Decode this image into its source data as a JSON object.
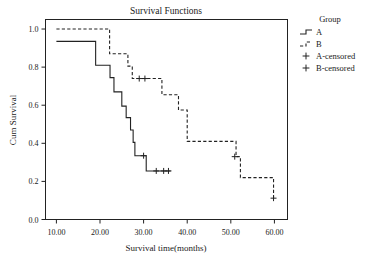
{
  "chart_data": {
    "type": "line",
    "subtype": "kaplan-meier-survival-step",
    "title": "Survival Functions",
    "xlabel": "Survival time(months)",
    "ylabel": "Cum Survival",
    "xlim": [
      7.5,
      63.0
    ],
    "ylim": [
      0.0,
      1.05
    ],
    "xticks": [
      10,
      20,
      30,
      40,
      50,
      60
    ],
    "xticklabels": [
      "10.00",
      "20.00",
      "30.00",
      "40.00",
      "50.00",
      "60.00"
    ],
    "yticks": [
      0.0,
      0.2,
      0.4,
      0.6,
      0.8,
      1.0
    ],
    "yticklabels": [
      "0.0",
      "0.2",
      "0.4",
      "0.6",
      "0.8",
      "1.0"
    ],
    "grid": false,
    "legend_position": "right",
    "legend_title": "Group",
    "legend_entries": [
      {
        "label": "A",
        "style": "solid-step"
      },
      {
        "label": "B",
        "style": "dashed-step"
      },
      {
        "label": "A-censored",
        "style": "plus-marker"
      },
      {
        "label": "B-censored",
        "style": "plus-marker"
      }
    ],
    "series": [
      {
        "name": "A",
        "style": "solid",
        "steps": [
          {
            "x": 10.0,
            "y": 0.935
          },
          {
            "x": 19.0,
            "y": 0.935
          },
          {
            "x": 19.0,
            "y": 0.81
          },
          {
            "x": 22.3,
            "y": 0.81
          },
          {
            "x": 22.3,
            "y": 0.745
          },
          {
            "x": 23.2,
            "y": 0.745
          },
          {
            "x": 23.2,
            "y": 0.67
          },
          {
            "x": 25.0,
            "y": 0.67
          },
          {
            "x": 25.0,
            "y": 0.595
          },
          {
            "x": 26.0,
            "y": 0.595
          },
          {
            "x": 26.0,
            "y": 0.535
          },
          {
            "x": 27.0,
            "y": 0.535
          },
          {
            "x": 27.0,
            "y": 0.47
          },
          {
            "x": 27.6,
            "y": 0.47
          },
          {
            "x": 27.6,
            "y": 0.405
          },
          {
            "x": 28.0,
            "y": 0.405
          },
          {
            "x": 28.0,
            "y": 0.335
          },
          {
            "x": 30.6,
            "y": 0.335
          },
          {
            "x": 30.6,
            "y": 0.255
          },
          {
            "x": 36.2,
            "y": 0.255
          }
        ],
        "censored_points": [
          {
            "x": 30.0,
            "y": 0.335
          },
          {
            "x": 32.9,
            "y": 0.255
          },
          {
            "x": 34.6,
            "y": 0.255
          },
          {
            "x": 35.7,
            "y": 0.255
          }
        ]
      },
      {
        "name": "B",
        "style": "dashed",
        "steps": [
          {
            "x": 10.0,
            "y": 1.0
          },
          {
            "x": 22.2,
            "y": 1.0
          },
          {
            "x": 22.2,
            "y": 0.87
          },
          {
            "x": 26.4,
            "y": 0.87
          },
          {
            "x": 26.4,
            "y": 0.805
          },
          {
            "x": 27.4,
            "y": 0.805
          },
          {
            "x": 27.4,
            "y": 0.74
          },
          {
            "x": 34.2,
            "y": 0.74
          },
          {
            "x": 34.2,
            "y": 0.655
          },
          {
            "x": 38.0,
            "y": 0.655
          },
          {
            "x": 38.0,
            "y": 0.575
          },
          {
            "x": 40.0,
            "y": 0.575
          },
          {
            "x": 40.0,
            "y": 0.41
          },
          {
            "x": 51.2,
            "y": 0.41
          },
          {
            "x": 51.2,
            "y": 0.33
          },
          {
            "x": 52.2,
            "y": 0.33
          },
          {
            "x": 52.2,
            "y": 0.22
          },
          {
            "x": 59.8,
            "y": 0.22
          },
          {
            "x": 59.8,
            "y": 0.112
          }
        ],
        "censored_points": [
          {
            "x": 29.0,
            "y": 0.74
          },
          {
            "x": 30.3,
            "y": 0.74
          },
          {
            "x": 50.9,
            "y": 0.33
          },
          {
            "x": 59.8,
            "y": 0.112
          }
        ]
      }
    ]
  },
  "colors": {
    "line": "#222222",
    "frame": "#222222",
    "background": "#ffffff"
  }
}
